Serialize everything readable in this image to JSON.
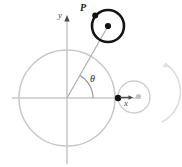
{
  "figure": {
    "kind": "geometry-diagram",
    "width": 182,
    "height": 167,
    "background_color": "#ffffff"
  },
  "labels": {
    "point_P": "P",
    "axis_y": "y",
    "axis_x": "x",
    "angle_theta": "θ"
  },
  "colors": {
    "fixed_circle_stroke": "#c9c9c9",
    "axis_stroke": "#c9c9c9",
    "rolling_circle_stroke": "#141414",
    "small_circle_stroke": "#cfcfcf",
    "radial_line_stroke": "#b0b0b0",
    "theta_arc_stroke": "#9a9a9a",
    "marker_fill": "#111111",
    "gray_marker_fill": "#c0c0c0",
    "rotation_arrow_stroke": "#dcdcdc",
    "label_dark": "#1a1a1a",
    "label_gray": "#4a4a4a"
  },
  "geometry": {
    "origin": {
      "x": 67,
      "y": 98,
      "label": "origin-marker"
    },
    "fixed_circle": {
      "cx": 67,
      "cy": 98,
      "r": 48,
      "name": "fixed-circle"
    },
    "axis_x": {
      "x1": 12,
      "y1": 98,
      "x2": 140,
      "y2": 98,
      "name": "x-axis"
    },
    "axis_y": {
      "x1": 67,
      "y1": 14,
      "x2": 67,
      "y2": 164,
      "name": "y-axis"
    },
    "rolling_circle": {
      "cx": 108,
      "cy": 26,
      "r": 16,
      "name": "rolling-circle"
    },
    "rolling_circle_center_marker": {
      "x": 108,
      "y": 26
    },
    "point_P_marker": {
      "x": 95,
      "y": 15
    },
    "radial_line": {
      "x1": 67,
      "y1": 98,
      "x2": 108,
      "y2": 26
    },
    "theta_arc": {
      "cx": 67,
      "cy": 98,
      "r": 26,
      "start_deg": 0,
      "end_deg": 60
    },
    "small_circle": {
      "cx": 134,
      "cy": 97,
      "r": 16,
      "name": "rolling-circle-start-position"
    },
    "tangent_marker": {
      "x": 118,
      "y": 98
    },
    "tangent_arrow": {
      "x1": 120,
      "y1": 98,
      "x2": 132,
      "y2": 98
    },
    "small_gray_marker": {
      "x": 138,
      "y": 97
    },
    "rotation_arrow": {
      "cx": 134,
      "cy": 97,
      "r": 35,
      "start_deg": -62,
      "end_deg": 46
    }
  }
}
